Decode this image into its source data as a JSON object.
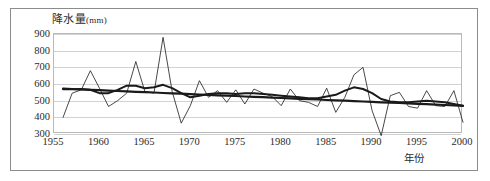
{
  "chart": {
    "title": "降水量",
    "title_unit": "(mm)",
    "xaxis_title": "年份"
  },
  "chart_data": {
    "type": "line",
    "title": "降水量(mm)",
    "xlabel": "年份",
    "ylabel": "降水量(mm)",
    "xlim": [
      1955,
      2000
    ],
    "ylim": [
      300,
      900
    ],
    "ytick_labels": [
      "900",
      "800",
      "700",
      "600",
      "500",
      "400",
      "300"
    ],
    "yticks": [
      900,
      800,
      700,
      600,
      500,
      400,
      300
    ],
    "xtick_labels": [
      "1955",
      "1960",
      "1965",
      "1970",
      "1975",
      "1980",
      "1985",
      "1990",
      "1995",
      "2000"
    ],
    "xticks": [
      1955,
      1960,
      1965,
      1970,
      1975,
      1980,
      1985,
      1990,
      1995,
      2000
    ],
    "grid": "horizontal",
    "legend": "none",
    "x": [
      1956,
      1957,
      1958,
      1959,
      1960,
      1961,
      1962,
      1963,
      1964,
      1965,
      1966,
      1967,
      1968,
      1969,
      1970,
      1971,
      1972,
      1973,
      1974,
      1975,
      1976,
      1977,
      1978,
      1979,
      1980,
      1981,
      1982,
      1983,
      1984,
      1985,
      1986,
      1987,
      1988,
      1989,
      1990,
      1991,
      1992,
      1993,
      1994,
      1995,
      1996,
      1997,
      1998,
      1999,
      2000
    ],
    "series": [
      {
        "name": "年降水量",
        "style": "thin-line",
        "values": [
          400,
          545,
          565,
          680,
          575,
          465,
          500,
          545,
          735,
          555,
          545,
          880,
          555,
          365,
          470,
          620,
          520,
          560,
          490,
          565,
          480,
          570,
          545,
          525,
          470,
          570,
          500,
          490,
          465,
          575,
          430,
          520,
          655,
          700,
          440,
          290,
          530,
          550,
          465,
          455,
          560,
          470,
          465,
          560,
          370
        ]
      },
      {
        "name": "5年滑动平均",
        "style": "thick-smoothed-line",
        "values": [
          568,
          568,
          570,
          565,
          545,
          545,
          565,
          590,
          590,
          575,
          580,
          595,
          575,
          545,
          520,
          530,
          540,
          545,
          545,
          540,
          545,
          545,
          540,
          535,
          530,
          525,
          520,
          515,
          515,
          525,
          535,
          560,
          580,
          570,
          545,
          510,
          495,
          490,
          490,
          495,
          500,
          495,
          490,
          480,
          470
        ]
      },
      {
        "name": "线性趋势",
        "style": "thick-straight-trend-line",
        "values": [
          572,
          570,
          567,
          565,
          563,
          560,
          558,
          556,
          553,
          551,
          549,
          546,
          544,
          542,
          539,
          537,
          535,
          532,
          530,
          528,
          525,
          523,
          521,
          518,
          516,
          514,
          511,
          509,
          507,
          504,
          502,
          500,
          497,
          495,
          493,
          490,
          488,
          486,
          483,
          481,
          479,
          476,
          474,
          472,
          469
        ]
      }
    ]
  }
}
